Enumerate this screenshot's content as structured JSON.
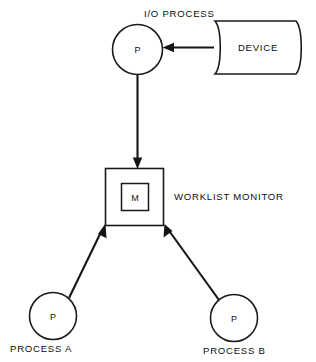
{
  "diagram": {
    "background_color": "#ffffff",
    "line_color": "#151515",
    "text_color": "#0d0d0d",
    "nodes": {
      "io_process": {
        "glyph": "P",
        "caption": "I/O PROCESS",
        "shape": "circle"
      },
      "device": {
        "label": "DEVICE",
        "shape": "magnetic-drum"
      },
      "monitor": {
        "glyph": "M",
        "caption": "WORKLIST MONITOR",
        "shape": "square-in-square"
      },
      "process_a": {
        "glyph": "P",
        "caption": "PROCESS A",
        "shape": "circle"
      },
      "process_b": {
        "glyph": "P",
        "caption": "PROCESS B",
        "shape": "circle"
      }
    },
    "edges": [
      {
        "id": "device-to-io",
        "from": "device",
        "to": "io_process",
        "direction": "left",
        "style": "solid-arrow"
      },
      {
        "id": "io-to-monitor",
        "from": "io_process",
        "to": "monitor",
        "direction": "down",
        "style": "solid-arrow"
      },
      {
        "id": "process-a-to-monitor",
        "from": "process_a",
        "to": "monitor",
        "direction": "up-right",
        "style": "solid-arrow"
      },
      {
        "id": "process-b-to-monitor",
        "from": "process_b",
        "to": "monitor",
        "direction": "up-left",
        "style": "solid-arrow"
      }
    ]
  }
}
